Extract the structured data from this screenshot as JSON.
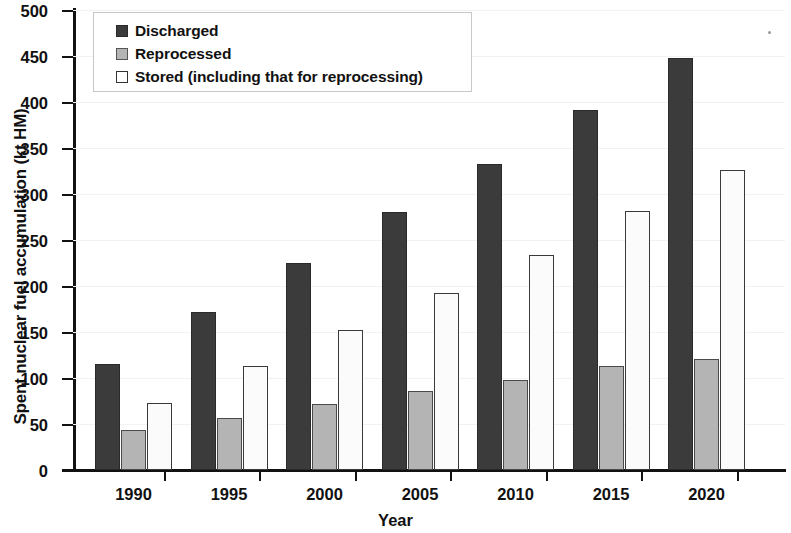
{
  "chart_data": {
    "type": "bar",
    "title": "",
    "xlabel": "Year",
    "ylabel": "Spent nuclear fuel accumulation (kt HM)",
    "categories": [
      "1990",
      "1995",
      "2000",
      "2005",
      "2010",
      "2015",
      "2020"
    ],
    "series": [
      {
        "name": "Discharged",
        "color": "#3b3b3b",
        "values": [
          115,
          172,
          225,
          280,
          333,
          391,
          448
        ]
      },
      {
        "name": "Reprocessed",
        "color": "#b4b4b4",
        "values": [
          43,
          57,
          72,
          86,
          98,
          113,
          121
        ]
      },
      {
        "name": "Stored (including that for reprocessing)",
        "color": "#ffffff",
        "values": [
          73,
          113,
          152,
          192,
          234,
          281,
          326
        ]
      }
    ],
    "ylim": [
      0,
      500
    ],
    "yticks": [
      0,
      50,
      100,
      150,
      200,
      250,
      300,
      350,
      400,
      450,
      500
    ],
    "ytick_labels": [
      "0",
      "50",
      "100",
      "150",
      "200",
      "250",
      "300",
      "350",
      "400",
      "450",
      "500"
    ],
    "grid": true,
    "legend_position": "top-left",
    "units": "kt HM"
  },
  "legend": {
    "items": [
      {
        "label": "Discharged",
        "swatch": "discharged"
      },
      {
        "label": "Reprocessed",
        "swatch": "reprocessed"
      },
      {
        "label": "Stored (including that for reprocessing)",
        "swatch": "stored"
      }
    ]
  },
  "axes": {
    "y_title": "Spent nuclear fuel accumulation (kt HM)",
    "x_title": "Year"
  }
}
